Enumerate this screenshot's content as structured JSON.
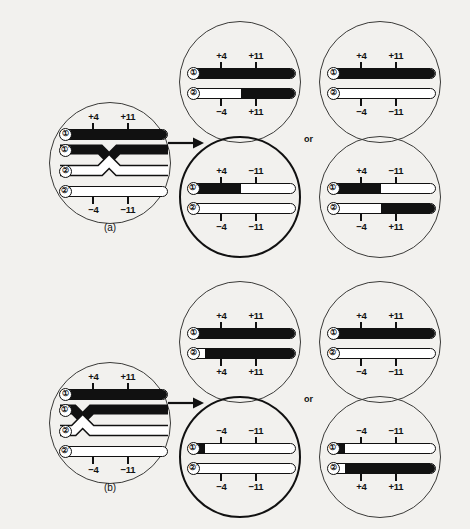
{
  "figure": {
    "caption_a": "(a)",
    "caption_b": "(b)",
    "or_label_top": "or",
    "or_label_bottom": "or",
    "markers": {
      "plus4": "+4",
      "plus11": "+11",
      "minus4": "−4",
      "minus11": "−11"
    },
    "strand_labels": {
      "one": "①",
      "one_prime": "①′",
      "two": "②",
      "two_prime": "②′"
    },
    "colors": {
      "ink": "#111111",
      "circle_stroke": "#3a3a38",
      "paper": "#f2f1ee",
      "chromatid_dark": "#111111",
      "chromatid_light": "#ffffff"
    }
  },
  "panels": [
    {
      "id": "a",
      "tag": "(a)",
      "crossover_position": "between +4 and +11",
      "parent_cell": {
        "name": "parent-cell-a",
        "strands": [
          {
            "label": "①",
            "top_labels": [
              "+4",
              "+11"
            ],
            "bottom_labels": [],
            "fill": "dark"
          },
          {
            "label": "①′",
            "top_labels": [],
            "bottom_labels": [],
            "fill": "dark"
          },
          {
            "label": "②",
            "top_labels": [],
            "bottom_labels": [],
            "fill": "light"
          },
          {
            "label": "②′",
            "top_labels": [],
            "bottom_labels": [
              "−4",
              "−11"
            ],
            "fill": "light"
          }
        ]
      },
      "outcomes": [
        {
          "name": "outcome-a-1-top",
          "emphasis": false,
          "rows": [
            {
              "label": "①",
              "segments": [
                {
                  "fill": "dark",
                  "pct": 100
                }
              ],
              "top_labels": [
                "+4",
                "+11"
              ],
              "bottom_labels": []
            },
            {
              "label": "②",
              "segments": [
                {
                  "fill": "light",
                  "pct": 48
                },
                {
                  "fill": "dark",
                  "pct": 52
                }
              ],
              "top_labels": [],
              "bottom_labels": [
                "−4",
                "+11"
              ]
            }
          ]
        },
        {
          "name": "outcome-a-1-bottom",
          "emphasis": true,
          "rows": [
            {
              "label": "①′",
              "segments": [
                {
                  "fill": "dark",
                  "pct": 48
                },
                {
                  "fill": "light",
                  "pct": 52
                }
              ],
              "top_labels": [
                "+4",
                "−11"
              ],
              "bottom_labels": []
            },
            {
              "label": "②′",
              "segments": [
                {
                  "fill": "light",
                  "pct": 100
                }
              ],
              "top_labels": [],
              "bottom_labels": [
                "−4",
                "−11"
              ]
            }
          ]
        },
        {
          "name": "outcome-a-2-top",
          "emphasis": false,
          "rows": [
            {
              "label": "①",
              "segments": [
                {
                  "fill": "dark",
                  "pct": 100
                }
              ],
              "top_labels": [
                "+4",
                "+11"
              ],
              "bottom_labels": []
            },
            {
              "label": "②",
              "segments": [
                {
                  "fill": "light",
                  "pct": 100
                }
              ],
              "top_labels": [],
              "bottom_labels": [
                "−4",
                "−11"
              ]
            }
          ]
        },
        {
          "name": "outcome-a-2-bottom",
          "emphasis": false,
          "rows": [
            {
              "label": "①′",
              "segments": [
                {
                  "fill": "dark",
                  "pct": 48
                },
                {
                  "fill": "light",
                  "pct": 52
                }
              ],
              "top_labels": [
                "+4",
                "−11"
              ],
              "bottom_labels": []
            },
            {
              "label": "②",
              "segments": [
                {
                  "fill": "light",
                  "pct": 48
                },
                {
                  "fill": "dark",
                  "pct": 52
                }
              ],
              "top_labels": [],
              "bottom_labels": [
                "−4",
                "+11"
              ]
            }
          ]
        }
      ]
    },
    {
      "id": "b",
      "tag": "(b)",
      "crossover_position": "left of +4",
      "parent_cell": {
        "name": "parent-cell-b",
        "strands": [
          {
            "label": "①",
            "top_labels": [
              "+4",
              "+11"
            ],
            "bottom_labels": [],
            "fill": "dark"
          },
          {
            "label": "①′",
            "top_labels": [],
            "bottom_labels": [],
            "fill": "dark"
          },
          {
            "label": "②",
            "top_labels": [],
            "bottom_labels": [],
            "fill": "light"
          },
          {
            "label": "②′",
            "top_labels": [],
            "bottom_labels": [
              "−4",
              "−11"
            ],
            "fill": "light"
          }
        ]
      },
      "outcomes": [
        {
          "name": "outcome-b-1-top",
          "emphasis": false,
          "rows": [
            {
              "label": "①",
              "segments": [
                {
                  "fill": "dark",
                  "pct": 100
                }
              ],
              "top_labels": [
                "+4",
                "+11"
              ],
              "bottom_labels": []
            },
            {
              "label": "②",
              "segments": [
                {
                  "fill": "light",
                  "pct": 15
                },
                {
                  "fill": "dark",
                  "pct": 85
                }
              ],
              "top_labels": [],
              "bottom_labels": [
                "+4",
                "+11"
              ]
            }
          ]
        },
        {
          "name": "outcome-b-1-bottom",
          "emphasis": true,
          "rows": [
            {
              "label": "①′",
              "segments": [
                {
                  "fill": "dark",
                  "pct": 15
                },
                {
                  "fill": "light",
                  "pct": 85
                }
              ],
              "top_labels": [
                "−4",
                "−11"
              ],
              "bottom_labels": []
            },
            {
              "label": "②′",
              "segments": [
                {
                  "fill": "light",
                  "pct": 100
                }
              ],
              "top_labels": [],
              "bottom_labels": [
                "−4",
                "−11"
              ]
            }
          ]
        },
        {
          "name": "outcome-b-2-top",
          "emphasis": false,
          "rows": [
            {
              "label": "①",
              "segments": [
                {
                  "fill": "dark",
                  "pct": 100
                }
              ],
              "top_labels": [
                "+4",
                "+11"
              ],
              "bottom_labels": []
            },
            {
              "label": "②′",
              "segments": [
                {
                  "fill": "light",
                  "pct": 100
                }
              ],
              "top_labels": [],
              "bottom_labels": [
                "−4",
                "−11"
              ]
            }
          ]
        },
        {
          "name": "outcome-b-2-bottom",
          "emphasis": false,
          "rows": [
            {
              "label": "①′",
              "segments": [
                {
                  "fill": "dark",
                  "pct": 15
                },
                {
                  "fill": "light",
                  "pct": 85
                }
              ],
              "top_labels": [
                "−4",
                "−11"
              ],
              "bottom_labels": []
            },
            {
              "label": "②",
              "segments": [
                {
                  "fill": "light",
                  "pct": 15
                },
                {
                  "fill": "dark",
                  "pct": 85
                }
              ],
              "top_labels": [],
              "bottom_labels": [
                "+4",
                "+11"
              ]
            }
          ]
        }
      ]
    }
  ]
}
